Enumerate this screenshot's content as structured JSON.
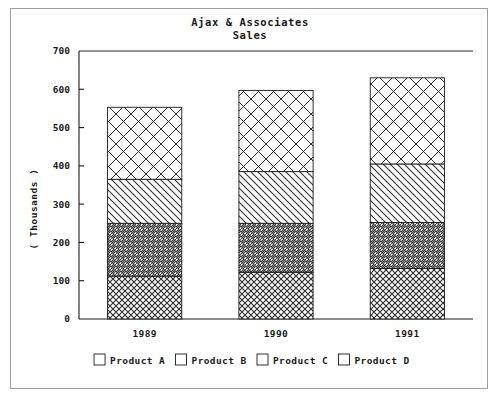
{
  "chart_data": {
    "type": "bar",
    "subtype": "stacked-vertical",
    "title": "Ajax & Associates",
    "subtitle": "Sales",
    "xlabel": "",
    "ylabel": "( Thousands )",
    "categories": [
      "1989",
      "1990",
      "1991"
    ],
    "ylim": [
      0,
      700
    ],
    "yticks": [
      0,
      100,
      200,
      300,
      400,
      500,
      600,
      700
    ],
    "ytick_labels": [
      "0",
      "100",
      "200",
      "300",
      "400",
      "500",
      "600",
      "700"
    ],
    "grid": false,
    "legend_position": "bottom",
    "series": [
      {
        "name": "Product A",
        "pattern": "fine-crosshatch",
        "values": [
          112,
          122,
          132
        ]
      },
      {
        "name": "Product B",
        "pattern": "backslash-diagonal",
        "values": [
          138,
          128,
          120
        ]
      },
      {
        "name": "Product C",
        "pattern": "forwardslash-diagonal",
        "values": [
          115,
          135,
          153
        ]
      },
      {
        "name": "Product D",
        "pattern": "large-crosshatch",
        "values": [
          188,
          212,
          225
        ]
      }
    ],
    "totals": [
      553,
      597,
      630
    ],
    "stack_tops": {
      "1989": {
        "A": 112,
        "B": 250,
        "C": 365,
        "D": 553
      },
      "1990": {
        "A": 122,
        "B": 250,
        "C": 385,
        "D": 597
      },
      "1991": {
        "A": 132,
        "B": 252,
        "C": 405,
        "D": 630
      }
    }
  },
  "legend": {
    "items": [
      {
        "label": "Product A",
        "swatch": "swatch-product-a"
      },
      {
        "label": "Product B",
        "swatch": "swatch-product-b"
      },
      {
        "label": "Product C",
        "swatch": "swatch-product-c"
      },
      {
        "label": "Product D",
        "swatch": "swatch-product-d"
      }
    ]
  },
  "caption": {
    "text": ""
  },
  "colors": {
    "ink": "#1b1b1b",
    "frame": "#9aa0a6",
    "background": "#ffffff",
    "hatch": "#2f2f2f"
  }
}
